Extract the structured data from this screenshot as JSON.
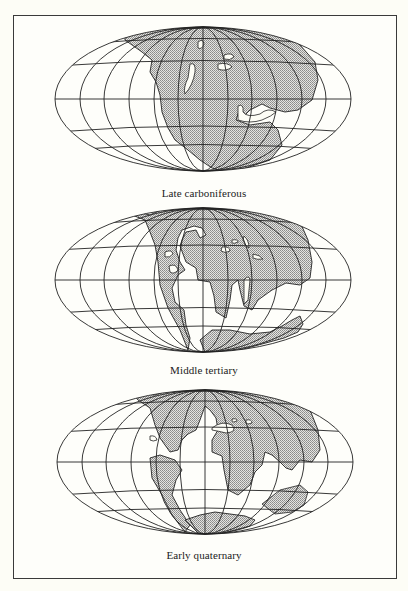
{
  "figure": {
    "maps": [
      {
        "id": "map-1",
        "caption": "Late carboniferous",
        "cx": 203,
        "cy": 99,
        "rx": 148,
        "ry": 72
      },
      {
        "id": "map-2",
        "caption": "Middle tertiary",
        "cx": 203,
        "cy": 280,
        "rx": 148,
        "ry": 72
      },
      {
        "id": "map-3",
        "caption": "Early quaternary",
        "cx": 205,
        "cy": 462,
        "rx": 148,
        "ry": 72
      }
    ],
    "graticule": {
      "meridians": 13,
      "parallels": 5
    },
    "colors": {
      "land": "#c8c8c8",
      "line": "#222222",
      "background": "#fdfdf6"
    }
  }
}
